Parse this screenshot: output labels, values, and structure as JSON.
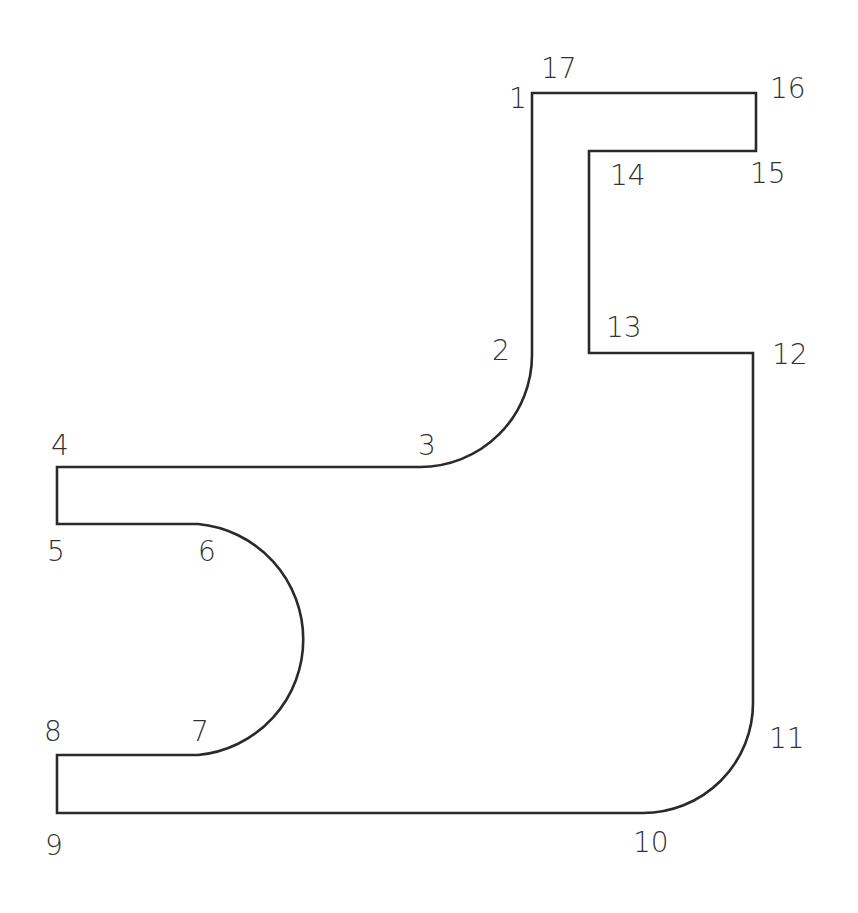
{
  "diagram": {
    "type": "engineering-profile-outline",
    "stroke_color": "#2a2a2a",
    "label_color": "#333333",
    "background": "#ffffff",
    "path": "M 532 93 L 756 93 L 756 151 L 589 151 L 589 353 L 753 353 L 753 703 A 110 110 0 0 1 643 813 L 57 813 L 57 755 L 198 755 A 116 116 0 0 0 198 524 L 57 524 L 57 467 L 420 467 A 112 112 0 0 0 532 355 Z",
    "vertices": [
      {
        "id": "1",
        "label": "1",
        "x": 532,
        "y": 93,
        "label_x": 509,
        "label_y": 108
      },
      {
        "id": "2",
        "label": "2",
        "x": 532,
        "y": 355,
        "label_x": 492,
        "label_y": 360
      },
      {
        "id": "3",
        "label": "3",
        "x": 420,
        "y": 467,
        "label_x": 418,
        "label_y": 455
      },
      {
        "id": "4",
        "label": "4",
        "x": 57,
        "y": 467,
        "label_x": 51,
        "label_y": 455
      },
      {
        "id": "5",
        "label": "5",
        "x": 57,
        "y": 524,
        "label_x": 47,
        "label_y": 561
      },
      {
        "id": "6",
        "label": "6",
        "x": 198,
        "y": 524,
        "label_x": 198,
        "label_y": 561
      },
      {
        "id": "7",
        "label": "7",
        "x": 198,
        "y": 755,
        "label_x": 191,
        "label_y": 741
      },
      {
        "id": "8",
        "label": "8",
        "x": 57,
        "y": 755,
        "label_x": 44,
        "label_y": 741
      },
      {
        "id": "9",
        "label": "9",
        "x": 57,
        "y": 813,
        "label_x": 45,
        "label_y": 855
      },
      {
        "id": "10",
        "label": "10",
        "x": 643,
        "y": 813,
        "label_x": 633,
        "label_y": 852
      },
      {
        "id": "11",
        "label": "11",
        "x": 753,
        "y": 703,
        "label_x": 769,
        "label_y": 748
      },
      {
        "id": "12",
        "label": "12",
        "x": 753,
        "y": 353,
        "label_x": 772,
        "label_y": 364
      },
      {
        "id": "13",
        "label": "13",
        "x": 589,
        "y": 353,
        "label_x": 606,
        "label_y": 337
      },
      {
        "id": "14",
        "label": "14",
        "x": 589,
        "y": 151,
        "label_x": 610,
        "label_y": 185
      },
      {
        "id": "15",
        "label": "15",
        "x": 756,
        "y": 151,
        "label_x": 750,
        "label_y": 183
      },
      {
        "id": "16",
        "label": "16",
        "x": 756,
        "y": 93,
        "label_x": 770,
        "label_y": 98
      },
      {
        "id": "17",
        "label": "17",
        "x": 532,
        "y": 93,
        "label_x": 541,
        "label_y": 78
      }
    ]
  }
}
